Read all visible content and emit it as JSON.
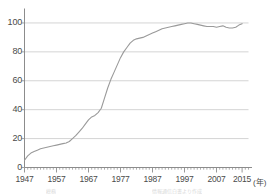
{
  "chart": {
    "x_axis_unit_label": "(年)",
    "source_note_left": "総務",
    "source_note_right": "情報通信白書より作成"
  },
  "chart_data": {
    "type": "line",
    "title": "",
    "subtitle": "",
    "xlabel": "(年)",
    "ylabel": "",
    "xlim": [
      1947,
      2017
    ],
    "ylim": [
      0,
      110
    ],
    "yticks": [
      0,
      20,
      40,
      60,
      80,
      100
    ],
    "xticks": [
      1947,
      1957,
      1967,
      1977,
      1987,
      1997,
      2007,
      2015
    ],
    "grid": true,
    "legend": "none",
    "line_color": "#9a9a9a",
    "grid_color": "#c9c9c9",
    "axis_color": "#8c8c8c",
    "text_color": "#4a4a4a",
    "x": [
      1947,
      1948,
      1949,
      1950,
      1951,
      1952,
      1953,
      1954,
      1955,
      1956,
      1957,
      1958,
      1959,
      1960,
      1961,
      1962,
      1963,
      1964,
      1965,
      1966,
      1967,
      1968,
      1969,
      1970,
      1971,
      1972,
      1973,
      1974,
      1975,
      1976,
      1977,
      1978,
      1979,
      1980,
      1981,
      1982,
      1983,
      1984,
      1985,
      1986,
      1987,
      1988,
      1989,
      1990,
      1991,
      1992,
      1993,
      1994,
      1995,
      1996,
      1997,
      1998,
      1999,
      2000,
      2001,
      2002,
      2003,
      2004,
      2005,
      2006,
      2007,
      2008,
      2009,
      2010,
      2011,
      2012,
      2013,
      2014,
      2015
    ],
    "values": [
      5,
      8,
      10,
      11,
      12,
      13,
      13.5,
      14,
      14.5,
      15,
      15.5,
      16,
      16.5,
      17,
      18,
      20,
      22,
      24.5,
      27,
      30,
      33,
      35,
      36,
      38,
      41,
      48,
      55,
      61,
      66,
      71,
      76,
      80,
      83,
      86,
      88,
      89,
      89.5,
      90,
      91,
      92,
      93,
      94,
      95,
      96,
      96.5,
      97,
      97.5,
      98,
      98.5,
      99,
      99.5,
      100,
      100,
      99.5,
      99,
      98.5,
      98,
      97.5,
      97.5,
      97.5,
      97,
      97.5,
      98,
      97,
      96.5,
      96.5,
      97,
      98.5,
      99.5
    ],
    "y_tick_labels": [
      "0",
      "20",
      "40",
      "60",
      "80",
      "100"
    ],
    "x_tick_labels": [
      "1947",
      "1957",
      "1967",
      "1977",
      "1987",
      "1997",
      "2007",
      "2015"
    ]
  }
}
